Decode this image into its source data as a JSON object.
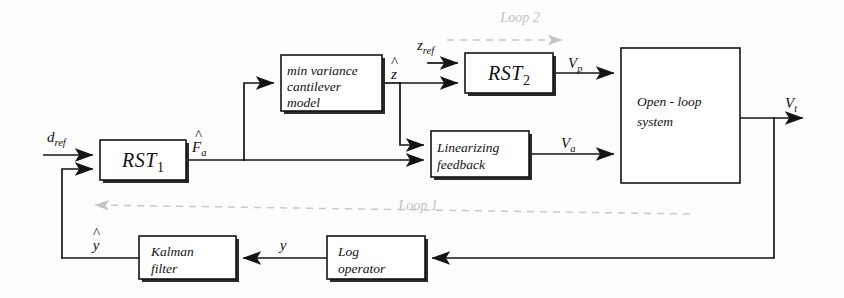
{
  "diagram": {
    "background_color": "#fdfdfd",
    "line_color": "#141414",
    "loop_color": "#c9c9c9",
    "blocks": [
      {
        "id": "rst1",
        "label_main": "RST",
        "label_sub": "1",
        "x": 100,
        "y": 140,
        "w": 86,
        "h": 40
      },
      {
        "id": "minvar",
        "line1": "min variance",
        "line2": "cantilever",
        "line3": "model",
        "x": 281,
        "y": 55,
        "w": 101,
        "h": 56
      },
      {
        "id": "rst2",
        "label_main": "RST",
        "label_sub": "2",
        "x": 465,
        "y": 53,
        "w": 88,
        "h": 40
      },
      {
        "id": "linfb",
        "line1": "Linearizing",
        "line2": "feedback",
        "x": 431,
        "y": 131,
        "w": 98,
        "h": 46
      },
      {
        "id": "openloop",
        "line1": "Open - loop",
        "line2": "system",
        "x": 621,
        "y": 48,
        "w": 119,
        "h": 135
      },
      {
        "id": "kalman",
        "line1": "Kalman",
        "line2": "filter",
        "x": 139,
        "y": 236,
        "w": 97,
        "h": 43
      },
      {
        "id": "logop",
        "line1": "Log",
        "line2": "operator",
        "x": 327,
        "y": 236,
        "w": 98,
        "h": 43
      }
    ],
    "signals": [
      {
        "id": "d_ref",
        "base": "d",
        "sub": "ref",
        "x": 47,
        "y": 137
      },
      {
        "id": "F_hat_a",
        "base": "F",
        "sub": "a",
        "hat": true,
        "x": 194,
        "y": 143
      },
      {
        "id": "z_hat",
        "base": "z",
        "sub": "",
        "hat": true,
        "x": 391,
        "y": 78
      },
      {
        "id": "z_ref",
        "base": "z",
        "sub": "ref",
        "x": 417,
        "y": 45
      },
      {
        "id": "V_p",
        "base": "V",
        "sub": "p",
        "x": 570,
        "y": 68
      },
      {
        "id": "V_a",
        "base": "V",
        "sub": "a",
        "x": 563,
        "y": 142
      },
      {
        "id": "V_t",
        "base": "V",
        "sub": "t",
        "x": 787,
        "y": 103
      },
      {
        "id": "y_hat",
        "base": "y",
        "sub": "",
        "hat": true,
        "x": 93,
        "y": 237
      },
      {
        "id": "y",
        "base": "y",
        "sub": "",
        "x": 283,
        "y": 244
      }
    ],
    "loops": [
      {
        "id": "loop2",
        "label": "Loop 2",
        "label_x": 520,
        "label_y": 22,
        "direction": "right"
      },
      {
        "id": "loop1",
        "label": "Loop 1",
        "label_x": 418,
        "label_y": 210,
        "direction": "left"
      }
    ]
  }
}
